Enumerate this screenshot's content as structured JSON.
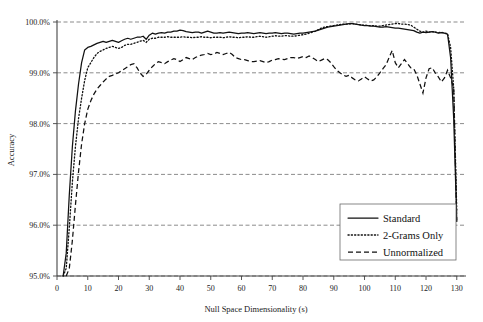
{
  "chart_data": {
    "type": "line",
    "title": "",
    "xlabel": "Null Space Dimensionality (s)",
    "ylabel": "Accuracy",
    "xlim": [
      0,
      133
    ],
    "ylim": [
      95.0,
      100.0
    ],
    "grid": true,
    "legend_position": "bottom-right",
    "x_ticks": [
      0,
      10,
      20,
      30,
      40,
      50,
      60,
      70,
      80,
      90,
      100,
      110,
      120,
      130
    ],
    "x_tick_labels": [
      "0",
      "10",
      "20",
      "30",
      "40",
      "50",
      "60",
      "70",
      "80",
      "90",
      "100",
      "110",
      "120",
      "130"
    ],
    "y_ticks": [
      95.0,
      96.0,
      97.0,
      98.0,
      99.0,
      100.0
    ],
    "y_tick_labels": [
      "95.0%",
      "96.0%",
      "97.0%",
      "98.0%",
      "99.0%",
      "100.0%"
    ],
    "series": [
      {
        "name": "Standard",
        "style": "solid",
        "color": "#111111",
        "x": [
          2,
          3,
          4,
          5,
          6,
          7,
          8,
          9,
          10,
          11,
          12,
          13,
          14,
          15,
          16,
          17,
          18,
          19,
          20,
          21,
          22,
          23,
          24,
          25,
          26,
          27,
          28,
          29,
          30,
          31,
          32,
          33,
          34,
          35,
          36,
          37,
          38,
          39,
          40,
          41,
          42,
          43,
          44,
          45,
          46,
          47,
          48,
          49,
          50,
          51,
          52,
          53,
          54,
          55,
          56,
          57,
          58,
          59,
          60,
          61,
          62,
          63,
          64,
          65,
          66,
          67,
          68,
          69,
          70,
          71,
          72,
          73,
          74,
          75,
          76,
          77,
          78,
          79,
          80,
          81,
          82,
          83,
          84,
          85,
          86,
          87,
          88,
          89,
          90,
          91,
          92,
          93,
          94,
          95,
          96,
          97,
          98,
          99,
          100,
          101,
          102,
          103,
          104,
          105,
          106,
          107,
          108,
          109,
          110,
          111,
          112,
          113,
          114,
          115,
          116,
          117,
          118,
          119,
          120,
          121,
          122,
          123,
          124,
          125,
          126,
          127,
          128,
          129,
          130
        ],
        "values": [
          95.0,
          95.45,
          96.6,
          97.55,
          98.25,
          98.78,
          99.2,
          99.45,
          99.5,
          99.52,
          99.55,
          99.58,
          99.6,
          99.62,
          99.6,
          99.62,
          99.64,
          99.62,
          99.6,
          99.63,
          99.66,
          99.68,
          99.66,
          99.68,
          99.7,
          99.7,
          99.72,
          99.66,
          99.74,
          99.78,
          99.76,
          99.78,
          99.79,
          99.78,
          99.8,
          99.8,
          99.82,
          99.82,
          99.84,
          99.83,
          99.81,
          99.8,
          99.79,
          99.8,
          99.8,
          99.78,
          99.8,
          99.82,
          99.8,
          99.78,
          99.78,
          99.79,
          99.78,
          99.79,
          99.8,
          99.79,
          99.78,
          99.77,
          99.78,
          99.78,
          99.79,
          99.78,
          99.77,
          99.78,
          99.79,
          99.78,
          99.77,
          99.78,
          99.78,
          99.79,
          99.78,
          99.77,
          99.78,
          99.78,
          99.77,
          99.76,
          99.77,
          99.78,
          99.78,
          99.79,
          99.8,
          99.81,
          99.82,
          99.84,
          99.86,
          99.88,
          99.9,
          99.91,
          99.92,
          99.93,
          99.94,
          99.95,
          99.96,
          99.97,
          99.97,
          99.96,
          99.95,
          99.94,
          99.93,
          99.93,
          99.92,
          99.92,
          99.91,
          99.9,
          99.9,
          99.91,
          99.9,
          99.89,
          99.88,
          99.88,
          99.87,
          99.86,
          99.85,
          99.84,
          99.83,
          99.8,
          99.78,
          99.8,
          99.79,
          99.8,
          99.81,
          99.8,
          99.78,
          99.79,
          99.78,
          99.76,
          99.3,
          98.1,
          96.1
        ]
      },
      {
        "name": "2-Grams Only",
        "style": "dotted",
        "color": "#111111",
        "x": [
          2,
          3,
          4,
          5,
          6,
          7,
          8,
          9,
          10,
          11,
          12,
          13,
          14,
          15,
          16,
          17,
          18,
          19,
          20,
          21,
          22,
          23,
          24,
          25,
          26,
          27,
          28,
          29,
          30,
          31,
          32,
          33,
          34,
          35,
          36,
          37,
          38,
          39,
          40,
          41,
          42,
          43,
          44,
          45,
          46,
          47,
          48,
          49,
          50,
          51,
          52,
          53,
          54,
          55,
          56,
          57,
          58,
          59,
          60,
          61,
          62,
          63,
          64,
          65,
          66,
          67,
          68,
          69,
          70,
          71,
          72,
          73,
          74,
          75,
          76,
          77,
          78,
          79,
          80,
          81,
          82,
          83,
          84,
          85,
          86,
          87,
          88,
          89,
          90,
          91,
          92,
          93,
          94,
          95,
          96,
          97,
          98,
          99,
          100,
          101,
          102,
          103,
          104,
          105,
          106,
          107,
          108,
          109,
          110,
          111,
          112,
          113,
          114,
          115,
          116,
          117,
          118,
          119,
          120,
          121,
          122,
          123,
          124,
          125,
          126,
          127,
          128,
          129,
          130
        ],
        "values": [
          95.0,
          95.15,
          95.95,
          96.85,
          97.55,
          98.1,
          98.5,
          98.85,
          99.1,
          99.2,
          99.3,
          99.38,
          99.42,
          99.45,
          99.48,
          99.5,
          99.52,
          99.5,
          99.48,
          99.5,
          99.54,
          99.56,
          99.56,
          99.58,
          99.6,
          99.62,
          99.64,
          99.6,
          99.66,
          99.68,
          99.68,
          99.7,
          99.7,
          99.7,
          99.71,
          99.7,
          99.7,
          99.7,
          99.7,
          99.71,
          99.7,
          99.7,
          99.69,
          99.7,
          99.7,
          99.71,
          99.7,
          99.7,
          99.69,
          99.7,
          99.7,
          99.7,
          99.69,
          99.7,
          99.71,
          99.7,
          99.7,
          99.69,
          99.7,
          99.7,
          99.71,
          99.7,
          99.7,
          99.71,
          99.72,
          99.71,
          99.7,
          99.71,
          99.72,
          99.73,
          99.72,
          99.72,
          99.73,
          99.73,
          99.72,
          99.72,
          99.73,
          99.74,
          99.75,
          99.76,
          99.78,
          99.8,
          99.82,
          99.85,
          99.88,
          99.9,
          99.91,
          99.92,
          99.93,
          99.94,
          99.95,
          99.96,
          99.96,
          99.96,
          99.97,
          99.96,
          99.95,
          99.94,
          99.94,
          99.93,
          99.93,
          99.93,
          99.92,
          99.92,
          99.93,
          99.94,
          99.95,
          99.96,
          99.97,
          99.97,
          99.96,
          99.96,
          99.95,
          99.94,
          99.9,
          99.86,
          99.82,
          99.8,
          99.82,
          99.8,
          99.81,
          99.8,
          99.79,
          99.8,
          99.78,
          99.77,
          99.5,
          98.7,
          96.3
        ]
      },
      {
        "name": "Unnormalized",
        "style": "dashed",
        "color": "#111111",
        "x": [
          3,
          4,
          5,
          6,
          7,
          8,
          9,
          10,
          11,
          12,
          13,
          14,
          15,
          16,
          17,
          18,
          19,
          20,
          21,
          22,
          23,
          24,
          25,
          26,
          27,
          28,
          29,
          30,
          31,
          32,
          33,
          34,
          35,
          36,
          37,
          38,
          39,
          40,
          41,
          42,
          43,
          44,
          45,
          46,
          47,
          48,
          49,
          50,
          51,
          52,
          53,
          54,
          55,
          56,
          57,
          58,
          59,
          60,
          61,
          62,
          63,
          64,
          65,
          66,
          67,
          68,
          69,
          70,
          71,
          72,
          73,
          74,
          75,
          76,
          77,
          78,
          79,
          80,
          81,
          82,
          83,
          84,
          85,
          86,
          87,
          88,
          89,
          90,
          91,
          92,
          93,
          94,
          95,
          96,
          97,
          98,
          99,
          100,
          101,
          102,
          103,
          104,
          105,
          106,
          107,
          108,
          109,
          110,
          111,
          112,
          113,
          114,
          115,
          116,
          117,
          118,
          119,
          120,
          121,
          122,
          123,
          124,
          125,
          126,
          127,
          128,
          129,
          130
        ],
        "values": [
          95.0,
          95.15,
          95.7,
          96.4,
          97.05,
          97.6,
          98.0,
          98.28,
          98.45,
          98.58,
          98.68,
          98.75,
          98.82,
          98.88,
          98.93,
          98.95,
          98.98,
          99.0,
          99.04,
          99.08,
          99.12,
          99.16,
          99.18,
          99.1,
          99.0,
          98.93,
          98.97,
          99.05,
          99.12,
          99.18,
          99.22,
          99.2,
          99.18,
          99.22,
          99.25,
          99.28,
          99.26,
          99.22,
          99.26,
          99.3,
          99.28,
          99.26,
          99.3,
          99.33,
          99.35,
          99.36,
          99.38,
          99.36,
          99.37,
          99.4,
          99.38,
          99.36,
          99.38,
          99.4,
          99.36,
          99.3,
          99.28,
          99.26,
          99.26,
          99.24,
          99.22,
          99.22,
          99.23,
          99.24,
          99.22,
          99.2,
          99.22,
          99.25,
          99.26,
          99.28,
          99.27,
          99.26,
          99.28,
          99.3,
          99.3,
          99.28,
          99.3,
          99.32,
          99.3,
          99.33,
          99.3,
          99.26,
          99.22,
          99.25,
          99.28,
          99.26,
          99.2,
          99.12,
          99.05,
          99.0,
          98.96,
          98.93,
          98.95,
          98.9,
          98.86,
          98.84,
          98.88,
          98.92,
          98.88,
          98.84,
          98.86,
          98.92,
          99.0,
          99.08,
          99.16,
          99.3,
          99.44,
          99.2,
          99.1,
          99.18,
          99.26,
          99.18,
          99.1,
          99.08,
          98.96,
          98.78,
          98.6,
          98.9,
          99.08,
          99.1,
          99.0,
          98.92,
          98.82,
          98.9,
          99.05,
          98.9,
          98.7,
          96.05
        ]
      }
    ]
  },
  "legend": {
    "entries": [
      {
        "label": "Standard",
        "style": "solid"
      },
      {
        "label": "2-Grams Only",
        "style": "dotted"
      },
      {
        "label": "Unnormalized",
        "style": "dashed"
      }
    ]
  },
  "axes": {
    "x_title": "Null Space Dimensionality (s)",
    "y_title": "Accuracy"
  }
}
